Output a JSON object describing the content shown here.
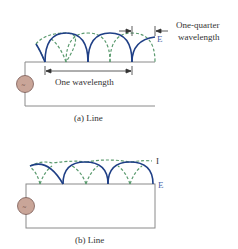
{
  "colors": {
    "wire": "#8a8a8a",
    "voltage_wave": "#1f3f86",
    "current_wave": "#5a9a6e",
    "source_fill": "#c9a598",
    "source_stroke": "#7a5a55",
    "text": "#333333",
    "label_E": "#4a5fa8"
  },
  "panel_a": {
    "caption": "(a) Line",
    "annotation_quarter_line1": "One-quarter",
    "annotation_quarter_line2": "wavelength",
    "annotation_full": "One wavelength",
    "voltage_label": "E",
    "source_symbol": "~"
  },
  "panel_b": {
    "caption": "(b) Line",
    "current_label": "I",
    "voltage_label": "E",
    "source_symbol": "~"
  }
}
